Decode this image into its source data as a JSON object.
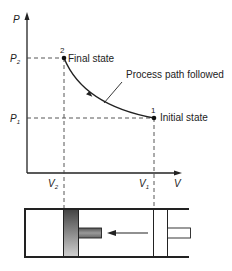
{
  "diagram": {
    "type": "pv-compression-process",
    "axes": {
      "y_label": "P",
      "x_label": "V",
      "p2_label": "P",
      "p2_sub": "2",
      "p1_label": "P",
      "p1_sub": "1",
      "v2_label": "V",
      "v2_sub": "2",
      "v1_label": "V",
      "v1_sub": "1"
    },
    "points": [
      {
        "id": "2",
        "label": "Final state"
      },
      {
        "id": "1",
        "label": "Initial state"
      }
    ],
    "annotation": "Process path followed",
    "colors": {
      "line": "#222222",
      "dashed": "#444444",
      "piston_dark": "#555555",
      "piston_light": "#bbbbbb",
      "rod": "#777777"
    }
  }
}
